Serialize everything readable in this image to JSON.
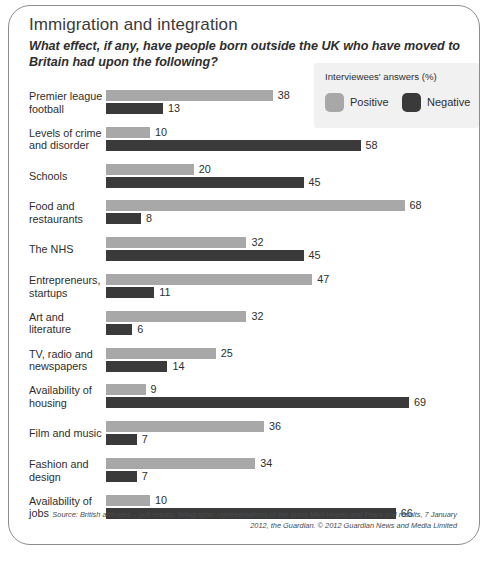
{
  "card": {
    "title": "Immigration and integration",
    "subtitle": "What effect, if any, have people born outside the UK who have moved to Britain had upon the following?",
    "source": "Source: British attitudes – poll results, Infographic representations of the Ipsos Mori Hopes and Fears poll results, 7 January 2012, the Guardian. © 2012 Guardian News and Media Limited"
  },
  "legend": {
    "title": "Interviewees' answers (%)",
    "entries": [
      {
        "label": "Positive",
        "color": "#a8a8a8",
        "key": "positive"
      },
      {
        "label": "Negative",
        "color": "#3a3a3a",
        "key": "negative"
      }
    ]
  },
  "colors": {
    "positive": "#a8a8a8",
    "negative": "#3a3a3a",
    "border": "#8c8c8c",
    "legend_background": "#f1f1f1",
    "text": "#2e2e2e"
  },
  "chart_data": {
    "type": "bar",
    "orientation": "horizontal",
    "title": "Immigration and integration",
    "subtitle": "What effect, if any, have people born outside the UK who have moved to Britain had upon the following?",
    "xlabel": "",
    "ylabel": "",
    "xlim": [
      0,
      69
    ],
    "grid": false,
    "legend_position": "top-right",
    "units": "%",
    "legend_title": "Interviewees' answers (%)",
    "categories": [
      "Premier league football",
      "Levels of crime and disorder",
      "Schools",
      "Food and restaurants",
      "The NHS",
      "Entrepreneurs, startups",
      "Art and literature",
      "TV, radio and newspapers",
      "Availability of housing",
      "Film and music",
      "Fashion and design",
      "Availability of jobs"
    ],
    "series": [
      {
        "name": "Positive",
        "color": "#a8a8a8",
        "values": [
          38,
          10,
          20,
          68,
          32,
          47,
          32,
          25,
          9,
          36,
          34,
          10
        ]
      },
      {
        "name": "Negative",
        "color": "#3a3a3a",
        "values": [
          13,
          58,
          45,
          8,
          45,
          11,
          6,
          14,
          69,
          7,
          7,
          66
        ]
      }
    ],
    "rows": [
      {
        "label_line1": "Premier league",
        "label_line2": "football",
        "positive": 38,
        "negative": 13
      },
      {
        "label_line1": "Levels of crime",
        "label_line2": "and disorder",
        "positive": 10,
        "negative": 58
      },
      {
        "label_line1": "Schools",
        "label_line2": "",
        "positive": 20,
        "negative": 45
      },
      {
        "label_line1": "Food and",
        "label_line2": "restaurants",
        "positive": 68,
        "negative": 8
      },
      {
        "label_line1": "The NHS",
        "label_line2": "",
        "positive": 32,
        "negative": 45
      },
      {
        "label_line1": "Entrepreneurs,",
        "label_line2": "startups",
        "positive": 47,
        "negative": 11
      },
      {
        "label_line1": "Art and",
        "label_line2": "literature",
        "positive": 32,
        "negative": 6
      },
      {
        "label_line1": "TV, radio and",
        "label_line2": "newspapers",
        "positive": 25,
        "negative": 14
      },
      {
        "label_line1": "Availability of",
        "label_line2": "housing",
        "positive": 9,
        "negative": 69
      },
      {
        "label_line1": "Film and music",
        "label_line2": "",
        "positive": 36,
        "negative": 7
      },
      {
        "label_line1": "Fashion and",
        "label_line2": "design",
        "positive": 34,
        "negative": 7
      },
      {
        "label_line1": "Availability of",
        "label_line2": "jobs",
        "positive": 10,
        "negative": 66
      }
    ]
  }
}
